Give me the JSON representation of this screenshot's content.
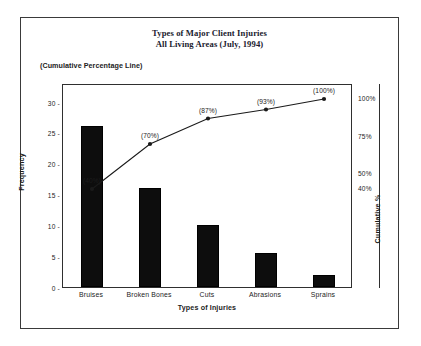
{
  "chart_data": {
    "type": "bar",
    "title": "Types of Major Client Injuries",
    "subtitle": "All Living Areas (July, 1994)",
    "annotation": "(Cumulative Percentage Line)",
    "xlabel": "Types of Injuries",
    "ylabel": "Frequency",
    "ylabel_secondary": "Cumulative %",
    "categories": [
      "Bruises",
      "Broken Bones",
      "Cuts",
      "Abrasions",
      "Sprains"
    ],
    "values": [
      26,
      16,
      10,
      5.5,
      2
    ],
    "ylim": [
      0,
      33
    ],
    "yticks": [
      0,
      5,
      10,
      15,
      20,
      25,
      30
    ],
    "ytick_labels": [
      "0",
      "5",
      "10",
      "15",
      "20",
      "25",
      "30"
    ],
    "secondary_ticks": [
      100,
      75,
      50,
      40
    ],
    "secondary_tick_labels": [
      "100%",
      "75%",
      "50%",
      "40%"
    ],
    "series": [
      {
        "name": "Cumulative Percentage Line",
        "type": "line",
        "values": [
          40,
          70,
          87,
          93,
          100
        ],
        "point_labels": [
          "(40%)",
          "(70%)",
          "(87%)",
          "(93%)",
          "(100%)"
        ]
      }
    ],
    "grid": false,
    "legend": "none",
    "bar_color": "#0d0d0d",
    "line_color": "#1a1a1a",
    "frame_color": "#2f2f2f"
  }
}
